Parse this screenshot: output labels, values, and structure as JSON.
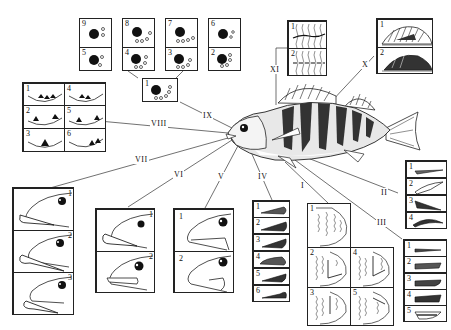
{
  "figure": {
    "roman_labels": {
      "I": "I",
      "II": "II",
      "III": "III",
      "IV": "IV",
      "V": "V",
      "VI": "VI",
      "VII": "VII",
      "VIII": "VIII",
      "IX": "IX",
      "X": "X",
      "XI": "XI"
    },
    "panels": {
      "IX": {
        "cells": [
          "9",
          "8",
          "7",
          "6",
          "5",
          "4",
          "3",
          "2",
          "1"
        ],
        "description": "eye with nostril pore rows"
      },
      "VIII": {
        "cells": [
          "1",
          "4",
          "2",
          "5",
          "3",
          "6"
        ],
        "description": "cross-section teeth patterns"
      },
      "VII": {
        "cells": [
          "1",
          "2",
          "3"
        ],
        "description": "head profile lower jaw"
      },
      "VI": {
        "cells": [
          "1",
          "2"
        ],
        "description": "head profile jaw"
      },
      "V": {
        "cells": [
          "1",
          "2"
        ],
        "description": "head profile mouth"
      },
      "IV": {
        "cells": [
          "1",
          "2",
          "3",
          "4",
          "5",
          "6"
        ],
        "description": "gill cover shapes"
      },
      "I": {
        "cells": [
          "1",
          "2",
          "4",
          "3",
          "5"
        ],
        "description": "operculum scale patterns"
      },
      "II": {
        "cells": [
          "1",
          "2",
          "3",
          "4"
        ],
        "description": "fin ray shapes"
      },
      "III": {
        "cells": [
          "1",
          "2",
          "3",
          "4",
          "5"
        ],
        "description": "pelvic fin shapes"
      },
      "X": {
        "cells": [
          "1",
          "2"
        ],
        "description": "dorsal fin patterns"
      },
      "XI": {
        "cells": [
          "1",
          "2"
        ],
        "description": "lateral line patterns"
      }
    }
  }
}
